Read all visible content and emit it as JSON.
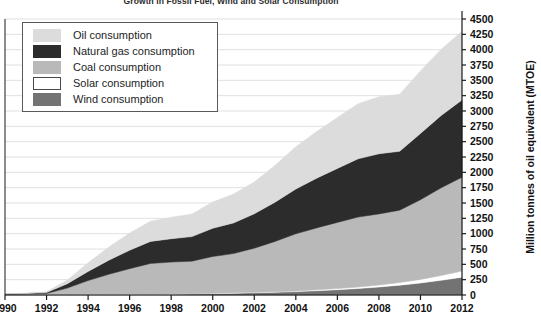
{
  "chart_data": {
    "type": "area",
    "stacked": true,
    "title": "Growth in Fossil Fuel, Wind and Solar Consumption",
    "xlabel": "",
    "ylabel": "Million tonnes of oil equivalent (MTOE)",
    "xlim": [
      1990,
      2012
    ],
    "ylim": [
      0,
      4500
    ],
    "ytick_step": 250,
    "xtick_step": 2,
    "grid": true,
    "legend_position": "top-left",
    "x": [
      1990,
      1991,
      1992,
      1993,
      1994,
      1995,
      1996,
      1997,
      1998,
      1999,
      2000,
      2001,
      2002,
      2003,
      2004,
      2005,
      2006,
      2007,
      2008,
      2009,
      2010,
      2011,
      2012
    ],
    "xticks": [
      "1990",
      "1992",
      "1994",
      "1996",
      "1998",
      "2000",
      "2002",
      "2004",
      "2006",
      "2008",
      "2010",
      "2012"
    ],
    "yticks": [
      "0",
      "250",
      "500",
      "750",
      "1000",
      "1250",
      "1500",
      "1750",
      "2000",
      "2250",
      "2500",
      "2750",
      "3000",
      "3250",
      "3500",
      "3750",
      "4000",
      "4250",
      "4500"
    ],
    "stack_order_bottom_to_top": [
      "Wind consumption",
      "Solar consumption",
      "Coal consumption",
      "Natural gas consumption",
      "Oil consumption"
    ],
    "series": [
      {
        "name": "Wind consumption",
        "key": "wind",
        "color": "#737373",
        "values": [
          0,
          0,
          0,
          2,
          4,
          6,
          8,
          11,
          14,
          18,
          23,
          29,
          36,
          45,
          56,
          70,
          86,
          106,
          130,
          160,
          196,
          240,
          290
        ]
      },
      {
        "name": "Solar consumption",
        "key": "solar",
        "color": "#ffffff",
        "values": [
          0,
          0,
          0,
          1,
          1,
          2,
          2,
          3,
          3,
          4,
          5,
          6,
          7,
          9,
          11,
          14,
          18,
          24,
          32,
          43,
          58,
          78,
          100
        ]
      },
      {
        "name": "Coal consumption",
        "key": "coal",
        "color": "#b9b9b9",
        "values": [
          10,
          15,
          25,
          110,
          230,
          330,
          420,
          500,
          520,
          530,
          600,
          640,
          720,
          820,
          930,
          1010,
          1080,
          1140,
          1160,
          1180,
          1300,
          1430,
          1530
        ]
      },
      {
        "name": "Natural gas consumption",
        "key": "gas",
        "color": "#2c2c2c",
        "values": [
          5,
          8,
          15,
          70,
          150,
          230,
          300,
          360,
          380,
          400,
          460,
          500,
          560,
          640,
          730,
          810,
          880,
          950,
          980,
          960,
          1080,
          1180,
          1260
        ]
      },
      {
        "name": "Oil consumption",
        "key": "oil",
        "color": "#dcdcdc",
        "values": [
          5,
          8,
          15,
          60,
          140,
          215,
          280,
          330,
          350,
          370,
          430,
          470,
          520,
          600,
          690,
          760,
          830,
          900,
          930,
          930,
          1020,
          1080,
          1120
        ]
      }
    ],
    "totals": [
      20,
      31,
      55,
      243,
      525,
      783,
      1010,
      1204,
      1267,
      1322,
      1518,
      1645,
      1843,
      2114,
      2417,
      2664,
      2894,
      3120,
      3232,
      3273,
      3654,
      4008,
      4300
    ]
  },
  "legend": {
    "items": [
      {
        "label": "Oil consumption",
        "color": "#dcdcdc",
        "border": "#dcdcdc"
      },
      {
        "label": "Natural gas consumption",
        "color": "#2c2c2c",
        "border": "#2c2c2c"
      },
      {
        "label": "Coal consumption",
        "color": "#b9b9b9",
        "border": "#b9b9b9"
      },
      {
        "label": "Solar consumption",
        "color": "#ffffff",
        "border": "#4a4a4a"
      },
      {
        "label": "Wind consumption",
        "color": "#737373",
        "border": "#737373"
      }
    ]
  },
  "colors": {
    "grid": "#d8d8d8",
    "axis": "#1a1a1a",
    "plot_background": "#ffffff",
    "text": "#121212"
  }
}
